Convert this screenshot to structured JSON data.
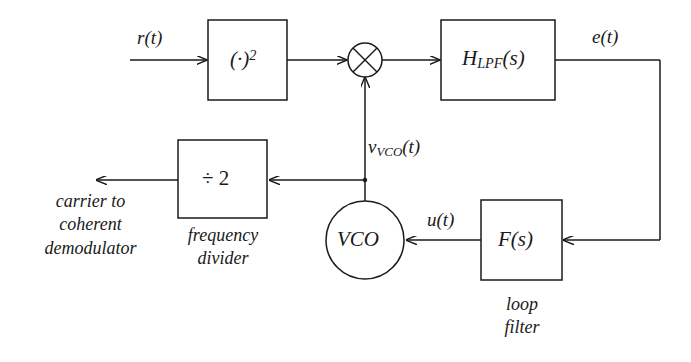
{
  "diagram": {
    "stroke_color": "#1a1a1a",
    "background_color": "#ffffff",
    "blocks": [
      {
        "id": "squarer",
        "label": "(·)",
        "exponent": "2",
        "x": 208,
        "y": 20,
        "w": 79,
        "h": 80
      },
      {
        "id": "lpf",
        "label": "H",
        "sub": "LPF",
        "suffix": "(s)",
        "x": 441,
        "y": 20,
        "w": 114,
        "h": 80
      },
      {
        "id": "divider",
        "label": "÷ 2",
        "x": 178,
        "y": 140,
        "w": 89,
        "h": 78
      },
      {
        "id": "loopfilt",
        "label": "F(s)",
        "x": 481,
        "y": 200,
        "w": 81,
        "h": 80
      }
    ],
    "nodes": [
      {
        "id": "mixer",
        "label": "",
        "shape": "circle-cross",
        "cx": 365,
        "cy": 60,
        "r": 17
      },
      {
        "id": "vco",
        "label": "VCO",
        "shape": "circle",
        "cx": 365,
        "cy": 240,
        "r": 39
      }
    ],
    "signal_labels": [
      {
        "id": "input",
        "text": "r(t)",
        "x": 137,
        "y": 27
      },
      {
        "id": "error",
        "text": "e(t)",
        "x": 592,
        "y": 26
      },
      {
        "id": "vco_out",
        "text": "v",
        "sub": "VCO",
        "suffix": "(t)",
        "x": 368,
        "y": 136
      },
      {
        "id": "ctrl",
        "text": "u(t)",
        "x": 427,
        "y": 209
      }
    ],
    "captions": [
      {
        "id": "carrier-caption",
        "text": "carrier to\ncoherent\ndemodulator",
        "x": 8,
        "y": 190,
        "w": 165
      },
      {
        "id": "divider-caption",
        "text": "frequency\ndivider",
        "x": 168,
        "y": 224,
        "w": 110
      },
      {
        "id": "loopfilter-caption",
        "text": "loop\nfilter",
        "x": 480,
        "y": 293,
        "w": 84
      }
    ]
  }
}
